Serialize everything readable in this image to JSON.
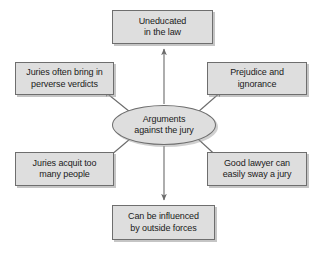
{
  "diagram": {
    "title": "Arguments against the jury",
    "type": "spoke-and-hub concept map",
    "colors": {
      "node_fill": "#dedede",
      "node_border": "#6e6e6e",
      "arrow": "#6b6b6b",
      "text": "#1a1a1a",
      "background": "#ffffff"
    },
    "center": {
      "id": "arguments-against-the-jury",
      "label": "Arguments\nagainst the jury",
      "shape": "ellipse"
    },
    "nodes": [
      {
        "id": "uneducated-in-the-law",
        "label": "Uneducated\nin the law",
        "position": "top"
      },
      {
        "id": "juries-bring-perverse-verdicts",
        "label": "Juries often bring in\nperverse verdicts",
        "position": "upper-left"
      },
      {
        "id": "prejudice-and-ignorance",
        "label": "Prejudice and\nignorance",
        "position": "upper-right"
      },
      {
        "id": "juries-acquit-too-many",
        "label": "Juries acquit too\nmany people",
        "position": "lower-left"
      },
      {
        "id": "good-lawyer-sways-jury",
        "label": "Good lawyer can\neasily sway a jury",
        "position": "lower-right"
      },
      {
        "id": "influenced-by-outside-forces",
        "label": "Can be influenced\nby outside forces",
        "position": "bottom"
      }
    ],
    "arrows": [
      {
        "id": "arrow-to-top",
        "from": "center",
        "to": "uneducated-in-the-law",
        "direction": "up"
      },
      {
        "id": "arrow-to-upper-left",
        "from": "center",
        "to": "juries-bring-perverse-verdicts",
        "direction": "up-left"
      },
      {
        "id": "arrow-to-upper-right",
        "from": "center",
        "to": "prejudice-and-ignorance",
        "direction": "up-right"
      },
      {
        "id": "arrow-to-lower-left",
        "from": "center",
        "to": "juries-acquit-too-many",
        "direction": "down-left"
      },
      {
        "id": "arrow-to-lower-right",
        "from": "center",
        "to": "good-lawyer-sways-jury",
        "direction": "down-right"
      },
      {
        "id": "arrow-to-bottom",
        "from": "center",
        "to": "influenced-by-outside-forces",
        "direction": "down"
      }
    ]
  }
}
